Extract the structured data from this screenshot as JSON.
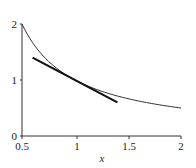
{
  "chart_data": {
    "type": "line",
    "title": "",
    "xlabel": "x",
    "ylabel": "",
    "xlim": [
      0.5,
      2
    ],
    "ylim": [
      0,
      2
    ],
    "grid": false,
    "legend": null,
    "x_ticks": [
      "0.5",
      "1",
      "1.5",
      "2"
    ],
    "y_ticks": [
      "0",
      "1",
      "2"
    ],
    "series": [
      {
        "name": "y = 1/x",
        "style": "thin",
        "x": [
          0.5,
          0.6,
          0.7,
          0.8,
          0.9,
          1.0,
          1.2,
          1.4,
          1.6,
          1.8,
          2.0
        ],
        "y": [
          2.0,
          1.667,
          1.429,
          1.25,
          1.111,
          1.0,
          0.833,
          0.714,
          0.625,
          0.556,
          0.5
        ]
      },
      {
        "name": "tangent at x=1 (y = 2 - x)",
        "style": "thick",
        "x": [
          0.6,
          1.4
        ],
        "y": [
          1.4,
          0.6
        ]
      }
    ]
  },
  "labels": {
    "x_axis": "x",
    "x_tick_0": "0.5",
    "x_tick_1": "1",
    "x_tick_2": "1.5",
    "x_tick_3": "2",
    "y_tick_0": "0",
    "y_tick_1": "1",
    "y_tick_2": "2"
  }
}
